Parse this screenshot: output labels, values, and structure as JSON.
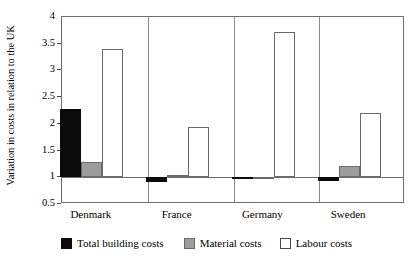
{
  "chart_data": {
    "type": "bar",
    "title": "",
    "xlabel": "",
    "ylabel": "Variation in costs in relation to the UK",
    "ylim": [
      0.5,
      4
    ],
    "yticks": [
      0.5,
      1,
      1.5,
      2,
      2.5,
      3,
      3.5,
      4
    ],
    "ytick_labels": [
      "0.5",
      "1",
      "1.5",
      "2",
      "2.5",
      "3",
      "3.5",
      "4"
    ],
    "baseline": 1,
    "grid": false,
    "legend_position": "bottom",
    "categories": [
      "Denmark",
      "France",
      "Germany",
      "Sweden"
    ],
    "series": [
      {
        "name": "Total building costs",
        "color": "#0b0b0b",
        "values": [
          2.27,
          0.91,
          0.98,
          0.93
        ]
      },
      {
        "name": "Material costs",
        "color": "#9d9d9d",
        "values": [
          1.28,
          1.05,
          1.0,
          1.22
        ]
      },
      {
        "name": "Labour costs",
        "color": "#ffffff",
        "values": [
          3.4,
          1.94,
          3.72,
          2.2
        ]
      }
    ]
  },
  "axis": {
    "y_title": "Variation in costs in relation to the UK",
    "tick_0": "4",
    "tick_1": "3.5",
    "tick_2": "3",
    "tick_3": "2.5",
    "tick_4": "2",
    "tick_5": "1.5",
    "tick_6": "1",
    "tick_7": "0.5"
  },
  "categories": {
    "c0": "Denmark",
    "c1": "France",
    "c2": "Germany",
    "c3": "Sweden"
  },
  "legend": {
    "item_0": "Total building costs",
    "item_1": "Material costs",
    "item_2": "Labour costs"
  },
  "colors": {
    "total": "#0b0b0b",
    "material": "#9d9d9d",
    "labour": "#ffffff",
    "frame": "#6e6e6e",
    "text": "#000000",
    "background": "#ffffff"
  }
}
